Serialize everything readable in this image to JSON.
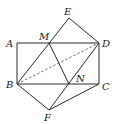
{
  "diagram": {
    "type": "geometry",
    "points": {
      "A": {
        "x": 17,
        "y": 43,
        "label": "A",
        "lx": 6,
        "ly": 47
      },
      "M": {
        "x": 49,
        "y": 43,
        "label": "M",
        "lx": 39,
        "ly": 40
      },
      "D": {
        "x": 99,
        "y": 43,
        "label": "D",
        "lx": 102,
        "ly": 47
      },
      "E": {
        "x": 69,
        "y": 18,
        "label": "E",
        "lx": 64,
        "ly": 15
      },
      "B": {
        "x": 17,
        "y": 84,
        "label": "B",
        "lx": 6,
        "ly": 88
      },
      "N": {
        "x": 69,
        "y": 84,
        "label": "N",
        "lx": 76,
        "ly": 82
      },
      "C": {
        "x": 99,
        "y": 84,
        "label": "C",
        "lx": 102,
        "ly": 90
      },
      "F": {
        "x": 49,
        "y": 110,
        "label": "F",
        "lx": 44,
        "ly": 121
      }
    },
    "segments": [
      [
        "A",
        "D"
      ],
      [
        "D",
        "C"
      ],
      [
        "C",
        "B"
      ],
      [
        "B",
        "A"
      ],
      [
        "B",
        "E"
      ],
      [
        "E",
        "D"
      ],
      [
        "M",
        "N"
      ],
      [
        "F",
        "D"
      ],
      [
        "B",
        "F"
      ],
      [
        "F",
        "C"
      ]
    ],
    "dashed_segments": [
      [
        "B",
        "D"
      ]
    ]
  }
}
